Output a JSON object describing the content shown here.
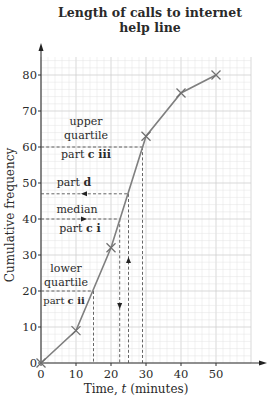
{
  "chart_data": {
    "type": "line",
    "title": "Length of calls to internet help line",
    "title_lines": [
      "Length of calls to internet",
      "help line"
    ],
    "xlabel": "Time, t (minutes)",
    "ylabel": "Cumulative frequency",
    "x": [
      0,
      10,
      20,
      30,
      40,
      50
    ],
    "series": [
      {
        "name": "Cumulative frequency",
        "values": [
          0,
          9,
          32,
          63,
          75,
          80
        ],
        "marker": "x",
        "color": "#7f7f7f"
      }
    ],
    "xticks": [
      0,
      10,
      20,
      30,
      40,
      50
    ],
    "yticks": [
      0,
      10,
      20,
      30,
      40,
      50,
      60,
      70,
      80
    ],
    "xlim": [
      0,
      60
    ],
    "ylim": [
      0,
      85
    ],
    "grid": true,
    "grid_color": "#e3e3e3",
    "annotations": [
      {
        "label": "lower quartile",
        "part": "part",
        "part_bold": "c ii",
        "y": 20,
        "x": 15,
        "arrow": "down"
      },
      {
        "label": "median",
        "part": "part",
        "part_bold": "c i",
        "y": 40,
        "x": 22.5,
        "arrow": "right-then-down"
      },
      {
        "label": "",
        "part": "part",
        "part_bold": "d",
        "y": 47,
        "x": 25,
        "arrow": "up-then-left"
      },
      {
        "label": "upper quartile",
        "part": "part",
        "part_bold": "c iii",
        "y": 60,
        "x": 29,
        "arrow": "none"
      }
    ]
  },
  "labels": {
    "title_line1": "Length of calls to internet",
    "title_line2": "help line",
    "xlabel_prefix": "Time, ",
    "xlabel_var": "t",
    "xlabel_suffix": " (minutes)",
    "ylabel": "Cumulative frequency",
    "xticks": [
      "0",
      "10",
      "20",
      "30",
      "40",
      "50"
    ],
    "yticks": [
      "0",
      "10",
      "20",
      "30",
      "40",
      "50",
      "60",
      "70",
      "80"
    ],
    "upper_quartile_1": "upper",
    "upper_quartile_2": "quartile",
    "part_word": "part",
    "part_c_iii": "c iii",
    "part_d": "d",
    "median": "median",
    "part_c_i": "c i",
    "lower_1": "lower",
    "lower_2": "quartile",
    "part_c_ii": "c ii"
  }
}
